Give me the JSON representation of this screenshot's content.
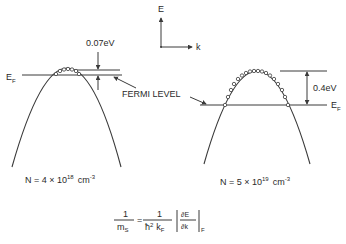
{
  "axes": {
    "energy_label": "E",
    "k_label": "k"
  },
  "left_band": {
    "fermi_label": "E",
    "fermi_sub": "F",
    "gap_label": "0.07eV",
    "density": {
      "prefix": "N = 4 × 10",
      "exp": "18",
      "unit": "cm",
      "unit_exp": "-3"
    }
  },
  "right_band": {
    "fermi_label": "E",
    "fermi_sub": "F",
    "gap_label": "0.4eV",
    "density": {
      "prefix": "N = 5 × 10",
      "exp": "19",
      "unit": "cm",
      "unit_exp": "-3"
    }
  },
  "fermi_level_label": "FERMI LEVEL",
  "formula": {
    "lhs_num": "1",
    "lhs_den": "m",
    "lhs_den_sub": "S",
    "equals": "=",
    "rhs_num": "1",
    "rhs_den": "ħ",
    "rhs_den_sup": "2",
    "rhs_den_k": "k",
    "rhs_den_k_sub": "F",
    "deriv_num": "∂E",
    "deriv_den": "∂k",
    "eval_sub": "F"
  }
}
